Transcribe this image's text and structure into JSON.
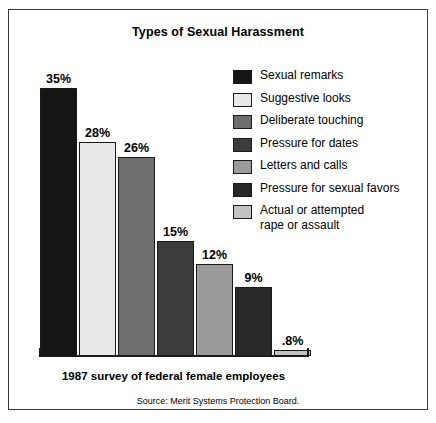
{
  "chart_data": {
    "type": "bar",
    "title": "Types of Sexual Harassment",
    "xlabel": "1987 survey of federal female employees",
    "ylabel": "",
    "ylim": [
      0,
      38
    ],
    "grid": false,
    "legend_position": "right",
    "source": "Source: Merit Systems Protection Board.",
    "categories": [
      "Sexual remarks",
      "Suggestive looks",
      "Deliberate touching",
      "Pressure for dates",
      "Letters and calls",
      "Pressure for sexual favors",
      "Actual or attempted\nrape or assault"
    ],
    "values": [
      35,
      28,
      26,
      15,
      12,
      9,
      0.8
    ],
    "value_labels": [
      "35%",
      "28%",
      "26%",
      "15%",
      "12%",
      "9%",
      ".8%"
    ],
    "colors": [
      "#151515",
      "#e8e8e8",
      "#6e6e6e",
      "#3c3c3c",
      "#9a9a9a",
      "#282828",
      "#c2c2c2"
    ]
  },
  "legend": {
    "items": [
      {
        "label": "Sexual remarks",
        "color": "#151515"
      },
      {
        "label": "Suggestive looks",
        "color": "#e8e8e8"
      },
      {
        "label": "Deliberate touching",
        "color": "#6e6e6e"
      },
      {
        "label": "Pressure for dates",
        "color": "#3c3c3c"
      },
      {
        "label": "Letters and calls",
        "color": "#9a9a9a"
      },
      {
        "label": "Pressure for sexual favors",
        "color": "#282828"
      },
      {
        "label": "Actual or attempted\nrape or assault",
        "color": "#c2c2c2"
      }
    ]
  }
}
